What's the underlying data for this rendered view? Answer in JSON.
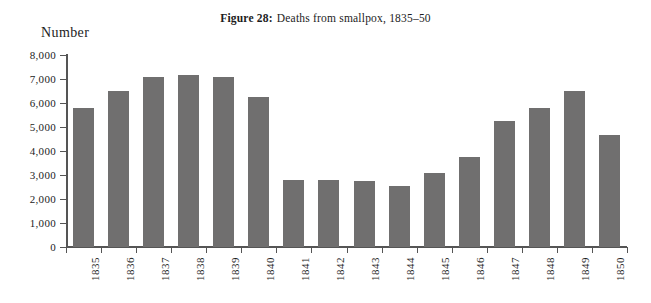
{
  "figure": {
    "label": "Figure 28:",
    "caption": "Deaths from smallpox, 1835–50"
  },
  "axis": {
    "y_title": "Number"
  },
  "colors": {
    "bar": "#706f6f",
    "axis": "#555555",
    "text": "#1c1c1c",
    "background": "#ffffff"
  },
  "chart_data": {
    "type": "bar",
    "xlabel": "",
    "ylabel": "Number",
    "ylim": [
      0,
      8000
    ],
    "yticks": [
      0,
      1000,
      2000,
      3000,
      4000,
      5000,
      6000,
      7000,
      8000
    ],
    "ytick_labels": [
      "0",
      "1,000",
      "2,000",
      "3,000",
      "4,000",
      "5,000",
      "6,000",
      "7,000",
      "8,000"
    ],
    "grid": false,
    "legend": false,
    "categories": [
      "1835",
      "1836",
      "1837",
      "1838",
      "1839",
      "1840",
      "1841",
      "1842",
      "1843",
      "1844",
      "1845",
      "1846",
      "1847",
      "1848",
      "1849",
      "1850"
    ],
    "values": [
      5800,
      6500,
      7100,
      7150,
      7100,
      6250,
      2800,
      2800,
      2750,
      2550,
      3100,
      3750,
      5250,
      5800,
      6500,
      4650
    ]
  }
}
